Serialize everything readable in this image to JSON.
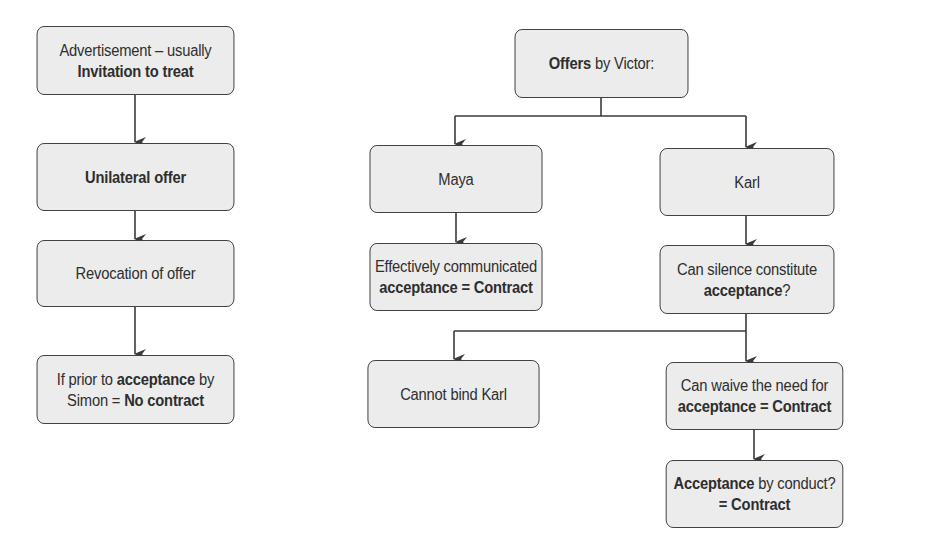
{
  "left_flow": {
    "advertisement": {
      "line1": "Advertisement – usually",
      "line2_bold": "Invitation to treat"
    },
    "unilateral": {
      "bold": "Unilateral offer"
    },
    "revocation": {
      "text": "Revocation of offer"
    },
    "prior": {
      "l1a": "If prior to ",
      "l1b_bold": "acceptance",
      "l1c": " by",
      "l2a": "Simon = ",
      "l2b_bold": "No contract"
    }
  },
  "right_flow": {
    "victor": {
      "bold": "Offers",
      "text": " by Victor:"
    },
    "maya": {
      "text": "Maya"
    },
    "karl": {
      "text": "Karl"
    },
    "effective": {
      "line1": "Effectively communicated",
      "line2_bold": "acceptance = Contract"
    },
    "silence": {
      "line1": "Can silence constitute",
      "line2_bold": "acceptance",
      "line2_end": "?"
    },
    "cannot_bind": {
      "text": "Cannot bind Karl"
    },
    "waive": {
      "line1": "Can waive the need for",
      "line2_bold": "acceptance = Contract"
    },
    "conduct": {
      "l1_bold": "Acceptance",
      "l1_text": " by conduct?",
      "line2_bold": "= Contract"
    }
  },
  "colors": {
    "box_fill": "#ececec",
    "box_border": "#3a3a3a",
    "arrow": "#3a3a3a"
  }
}
